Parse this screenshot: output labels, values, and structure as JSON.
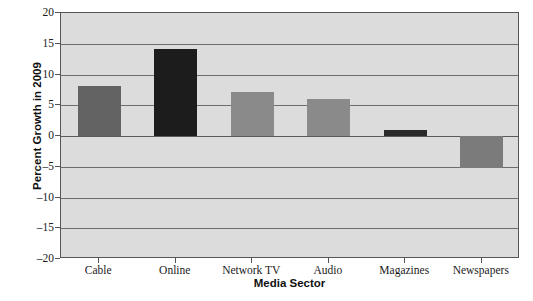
{
  "chart_data": {
    "type": "bar",
    "title": "",
    "xlabel": "Media Sector",
    "ylabel": "Percent Growth in 2009",
    "categories": [
      "Cable",
      "Online",
      "Network TV",
      "Audio",
      "Magazines",
      "Newspapers"
    ],
    "values": [
      8.2,
      14.2,
      7.2,
      6.0,
      1.0,
      -5.2
    ],
    "bar_colors": [
      "#636363",
      "#1c1c1c",
      "#8a8a8a",
      "#8a8a8a",
      "#2a2a2a",
      "#7b7b7b"
    ],
    "ylim": [
      -20,
      20
    ],
    "yticks": [
      20,
      15,
      10,
      5,
      0,
      -5,
      -10,
      -15,
      -20
    ],
    "ytick_labels": [
      "20",
      "15",
      "10",
      "5",
      "0",
      "–5",
      "–10",
      "–15",
      "–20"
    ],
    "grid": true,
    "legend": "none",
    "plot_background": "#dcdcdc",
    "gridline_color": "#6d6d6d",
    "axis_color": "#555555"
  }
}
